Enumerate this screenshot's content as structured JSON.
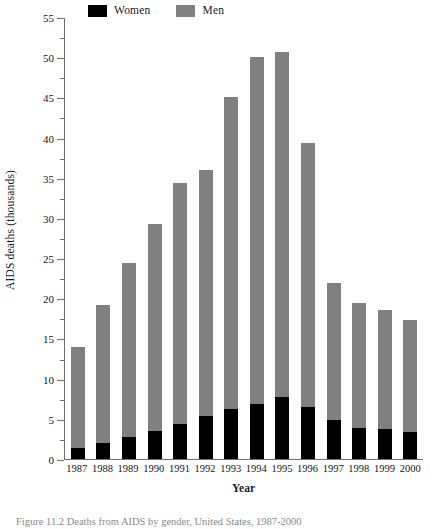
{
  "chart_data": {
    "type": "bar",
    "stacked": true,
    "title": "",
    "xlabel": "Year",
    "ylabel": "AIDS deaths (thousands)",
    "ylim": [
      0,
      55
    ],
    "ytick_step": 5,
    "yminor_step": 2.5,
    "grid": false,
    "legend_position": "top",
    "categories": [
      "1987",
      "1988",
      "1989",
      "1990",
      "1991",
      "1992",
      "1993",
      "1994",
      "1995",
      "1996",
      "1997",
      "1998",
      "1999",
      "2000"
    ],
    "yticks": [
      "0",
      "5",
      "10",
      "15",
      "20",
      "25",
      "30",
      "35",
      "40",
      "45",
      "50",
      "55"
    ],
    "series": [
      {
        "name": "Women",
        "color": "#000000",
        "values": [
          1.4,
          2.0,
          2.7,
          3.5,
          4.3,
          5.3,
          6.2,
          6.9,
          7.7,
          6.5,
          4.9,
          3.8,
          3.7,
          3.3
        ]
      },
      {
        "name": "Men",
        "color": "#808080",
        "values": [
          12.5,
          17.2,
          21.7,
          25.8,
          30.1,
          30.7,
          38.8,
          43.1,
          42.9,
          32.8,
          17.0,
          15.6,
          14.9,
          14.0
        ]
      }
    ],
    "totals": [
      13.9,
      19.2,
      24.4,
      29.3,
      34.4,
      36.0,
      45.0,
      50.0,
      50.6,
      39.3,
      21.9,
      19.4,
      18.6,
      17.3
    ],
    "caption": "Figure 11.2 Deaths from AIDS by gender, United States, 1987-2000"
  },
  "legend": {
    "entries": [
      {
        "label": "Women",
        "color": "#000000"
      },
      {
        "label": "Men",
        "color": "#808080"
      }
    ]
  }
}
